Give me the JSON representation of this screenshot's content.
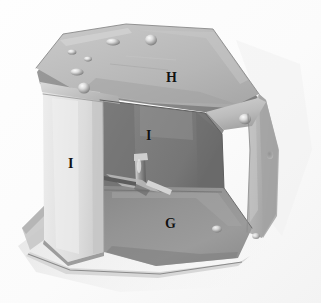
{
  "figure": {
    "kind": "photograph",
    "width_px": 321,
    "height_px": 303,
    "background_color": "#ffffff"
  },
  "labels": [
    {
      "id": "H",
      "text": "H",
      "part": "top-mounting-plate",
      "x": 166,
      "y": 71
    },
    {
      "id": "I-back",
      "text": "I",
      "part": "interior-back-panel",
      "x": 146,
      "y": 129
    },
    {
      "id": "I-left",
      "text": "I",
      "part": "left-side-panel",
      "x": 68,
      "y": 157
    },
    {
      "id": "G",
      "text": "G",
      "part": "bottom-floor-panel",
      "x": 165,
      "y": 217
    }
  ],
  "palette": {
    "background_light": "#fdfdfd",
    "background_shadow": "#e9e9e9",
    "top_plate": "#bdbdbd",
    "top_plate_dark": "#a7a7a7",
    "left_panel_bright": "#e2e2e2",
    "left_panel_edge": "#cfcfcf",
    "interior_back": "#7d7d7d",
    "interior_back_dark": "#6a6a6a",
    "floor_panel": "#919191",
    "right_panel": "#b4b4b4",
    "right_panel_dark": "#9a9a9a",
    "rivet_highlight": "#f2f2f2",
    "rivet_shadow": "#6f6f6f",
    "edge_line": "#5d5d5d",
    "label_color": "#121212"
  },
  "hardware": {
    "rivets": [
      {
        "name": "rivet-top-left-small",
        "cx": 72,
        "cy": 52,
        "r": 3.2
      },
      {
        "name": "rivet-top-mid-small",
        "cx": 87,
        "cy": 58,
        "r": 2.6
      },
      {
        "name": "rivet-top-center",
        "cx": 112,
        "cy": 42,
        "r": 5.2
      },
      {
        "name": "rivet-top-right",
        "cx": 151,
        "cy": 40,
        "r": 5.4
      },
      {
        "name": "rivet-top-lower-left",
        "cx": 77,
        "cy": 72,
        "r": 5.0
      },
      {
        "name": "rivet-front-flange",
        "cx": 84,
        "cy": 88,
        "r": 5.6
      },
      {
        "name": "rivet-right-flange",
        "cx": 245,
        "cy": 120,
        "r": 5.2
      },
      {
        "name": "rivet-right-panel",
        "cx": 270,
        "cy": 155,
        "r": 3.0
      },
      {
        "name": "rivet-floor-front",
        "cx": 217,
        "cy": 229,
        "r": 4.4
      },
      {
        "name": "rivet-right-bottom",
        "cx": 256,
        "cy": 235,
        "r": 3.4
      }
    ],
    "interior_fastener": {
      "name": "interior-bolt-assembly",
      "x": 128,
      "y": 160,
      "w": 26,
      "h": 32
    }
  }
}
